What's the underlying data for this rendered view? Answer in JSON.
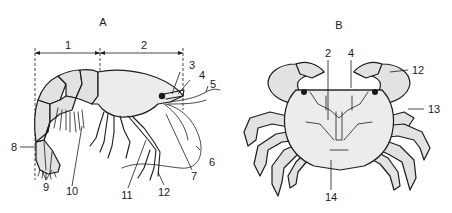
{
  "figure": {
    "panels": [
      {
        "id": "A",
        "title": "A",
        "subject": "shrimp",
        "labels": [
          "1",
          "2",
          "3",
          "4",
          "5",
          "6",
          "7",
          "8",
          "9",
          "10",
          "11",
          "12"
        ]
      },
      {
        "id": "B",
        "title": "B",
        "subject": "crab",
        "labels": [
          "2",
          "4",
          "12",
          "13",
          "14"
        ]
      }
    ]
  }
}
